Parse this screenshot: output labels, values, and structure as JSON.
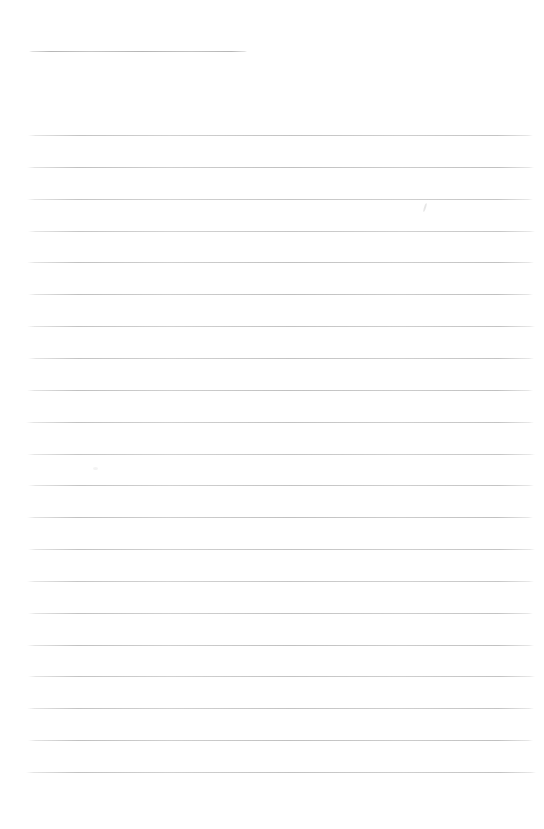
{
  "document": {
    "kind": "scanned-blank-lined-page",
    "background_color": "#ffffff",
    "text_content": ""
  },
  "header_line": {
    "y": 51,
    "x1": 29,
    "x2": 247,
    "color": "#aeaeae",
    "alpha": 0.9
  },
  "ruled_lines": {
    "color": "#bdbdbd",
    "count": 21,
    "lines": [
      {
        "y": 135,
        "x1": 28,
        "x2": 533,
        "alpha": 0.9
      },
      {
        "y": 167,
        "x1": 27,
        "x2": 534,
        "alpha": 0.95
      },
      {
        "y": 199,
        "x1": 27,
        "x2": 533,
        "alpha": 0.88
      },
      {
        "y": 231,
        "x1": 28,
        "x2": 535,
        "alpha": 0.85
      },
      {
        "y": 262,
        "x1": 27,
        "x2": 534,
        "alpha": 0.92
      },
      {
        "y": 294,
        "x1": 28,
        "x2": 533,
        "alpha": 0.95
      },
      {
        "y": 326,
        "x1": 27,
        "x2": 535,
        "alpha": 0.9
      },
      {
        "y": 358,
        "x1": 28,
        "x2": 534,
        "alpha": 0.9
      },
      {
        "y": 390,
        "x1": 27,
        "x2": 533,
        "alpha": 0.94
      },
      {
        "y": 422,
        "x1": 26,
        "x2": 534,
        "alpha": 0.9
      },
      {
        "y": 454,
        "x1": 27,
        "x2": 535,
        "alpha": 0.86
      },
      {
        "y": 485,
        "x1": 28,
        "x2": 534,
        "alpha": 0.9
      },
      {
        "y": 517,
        "x1": 27,
        "x2": 533,
        "alpha": 0.94
      },
      {
        "y": 549,
        "x1": 28,
        "x2": 535,
        "alpha": 0.9
      },
      {
        "y": 581,
        "x1": 27,
        "x2": 534,
        "alpha": 0.86
      },
      {
        "y": 613,
        "x1": 28,
        "x2": 533,
        "alpha": 0.9
      },
      {
        "y": 645,
        "x1": 27,
        "x2": 534,
        "alpha": 0.94
      },
      {
        "y": 676,
        "x1": 28,
        "x2": 535,
        "alpha": 0.9
      },
      {
        "y": 708,
        "x1": 27,
        "x2": 534,
        "alpha": 0.9
      },
      {
        "y": 740,
        "x1": 28,
        "x2": 533,
        "alpha": 0.94
      },
      {
        "y": 772,
        "x1": 26,
        "x2": 536,
        "alpha": 0.9
      }
    ]
  },
  "artifacts": [
    {
      "x": 424,
      "y": 203,
      "width": 2,
      "height": 9,
      "rotation": 18,
      "color": "#dcdcdc"
    },
    {
      "x": 93,
      "y": 467,
      "width": 5,
      "height": 3,
      "rotation": 0,
      "color": "#eeeeee"
    }
  ]
}
